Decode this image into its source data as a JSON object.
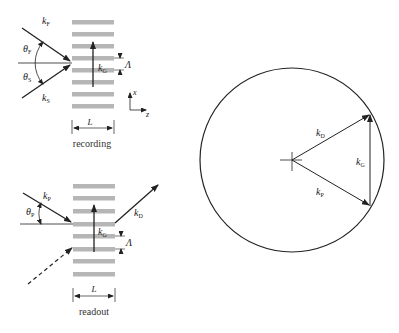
{
  "recording_panel": {
    "caption": "recording",
    "grating_width_label": "L",
    "period_label": "Λ",
    "grating_vector": {
      "symbol": "k",
      "sub": "G"
    },
    "beam_reference": {
      "symbol": "k",
      "sub": "F"
    },
    "beam_signal": {
      "symbol": "k",
      "sub": "S"
    },
    "angle_reference": {
      "symbol": "θ",
      "sub": "F"
    },
    "angle_signal": {
      "symbol": "θ",
      "sub": "S"
    },
    "axes": {
      "x": "x",
      "z": "z"
    },
    "stripe_count": 8
  },
  "readout_panel": {
    "caption": "readout",
    "grating_width_label": "L",
    "period_label": "Λ",
    "grating_vector": {
      "symbol": "k",
      "sub": "G"
    },
    "beam_probe": {
      "symbol": "k",
      "sub": "P"
    },
    "beam_diffracted": {
      "symbol": "k",
      "sub": "D"
    },
    "angle_probe": {
      "symbol": "θ",
      "sub": "P"
    },
    "stripe_count": 8
  },
  "ewald_sphere": {
    "vector_diffracted": {
      "symbol": "k",
      "sub": "D"
    },
    "vector_probe": {
      "symbol": "k",
      "sub": "P"
    },
    "vector_grating": {
      "symbol": "k",
      "sub": "G"
    }
  }
}
